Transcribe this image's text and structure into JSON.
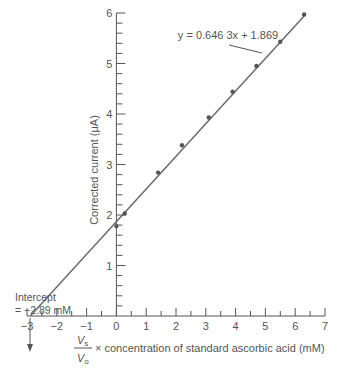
{
  "chart_data": {
    "type": "scatter",
    "title": "",
    "xlabel_prefix_num": "V",
    "xlabel_prefix_num_sub": "s",
    "xlabel_prefix_den": "V",
    "xlabel_prefix_den_sub": "o",
    "xlabel": "× concentration of standard ascorbic acid (mM)",
    "ylabel": "Corrected current (μA)",
    "xlim": [
      -3,
      7
    ],
    "ylim": [
      0,
      6
    ],
    "x_ticks": [
      "−3",
      "−2",
      "−1",
      "0",
      "1",
      "2",
      "3",
      "4",
      "5",
      "6",
      "7"
    ],
    "y_ticks": [
      "1",
      "2",
      "3",
      "4",
      "5",
      "6"
    ],
    "grid": false,
    "points": {
      "x": [
        0,
        0.28,
        1.4,
        2.2,
        3.1,
        3.9,
        4.7,
        5.5,
        6.3
      ],
      "y": [
        1.78,
        2.03,
        2.84,
        3.38,
        3.93,
        4.44,
        4.95,
        5.43,
        5.97
      ]
    },
    "fit_line": {
      "slope": 0.6463,
      "intercept": 1.869,
      "x_range": [
        -2.89,
        6.3
      ],
      "label": "y = 0.646 3x + 1.869"
    },
    "annotations": [
      {
        "text_line1": "Intercept",
        "text_line2": "= −2.89 mM",
        "x": -2.89,
        "y": 0
      }
    ]
  }
}
